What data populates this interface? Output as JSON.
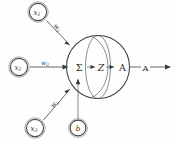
{
  "diagram": {
    "colors": {
      "stroke": "#4a4a4a",
      "sphere_stroke": "#3c3c3c",
      "sphere_arc": "#707070",
      "text": "#1f1f1f",
      "background": "#fefefe"
    },
    "inputs": [
      {
        "id": "x1",
        "base": "x",
        "subscript": "1",
        "weight_base": "w",
        "weight_subscript": "1"
      },
      {
        "id": "x2",
        "base": "x",
        "subscript": "2",
        "weight_base": "w",
        "weight_subscript": "2"
      },
      {
        "id": "x3",
        "base": "x",
        "subscript": "3",
        "weight_base": "w",
        "weight_subscript": "3"
      }
    ],
    "bias": {
      "id": "b",
      "label": "b"
    },
    "core": {
      "summation": "Σ",
      "net_input": "Z",
      "activation": "A"
    },
    "output": {
      "label": "A"
    }
  }
}
